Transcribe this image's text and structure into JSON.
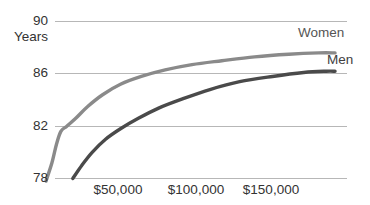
{
  "chart_data": {
    "type": "line",
    "title": "",
    "subtitle": "",
    "xlabel": "",
    "ylabel": "Years",
    "xlim": [
      0,
      200000
    ],
    "ylim": [
      78,
      90
    ],
    "grid": true,
    "legend_position": "inline-right",
    "y_ticks": [
      {
        "value": 90,
        "label": "90"
      },
      {
        "value": 86,
        "label": "86"
      },
      {
        "value": 82,
        "label": "82"
      },
      {
        "value": 78,
        "label": "78"
      }
    ],
    "x_ticks": [
      {
        "value": 50000,
        "label": "$50,000"
      },
      {
        "value": 100000,
        "label": "$100,000"
      },
      {
        "value": 150000,
        "label": "$150,000"
      }
    ],
    "series": [
      {
        "name": "Women",
        "label": "Women",
        "color": "#8a8a8a",
        "x": [
          2000,
          6000,
          9000,
          12000,
          16000,
          22000,
          30000,
          40000,
          52000,
          66000,
          82000,
          100000,
          120000,
          142000,
          165000,
          185000,
          196000
        ],
        "values": [
          77.8,
          79.2,
          80.6,
          81.6,
          82.0,
          82.6,
          83.5,
          84.4,
          85.2,
          85.8,
          86.3,
          86.7,
          87.0,
          87.3,
          87.5,
          87.6,
          87.6
        ]
      },
      {
        "name": "Men",
        "label": "Men",
        "color": "#4a4a4a",
        "color_note": "darker gray",
        "x": [
          20000,
          26000,
          33000,
          42000,
          52000,
          64000,
          78000,
          94000,
          112000,
          132000,
          154000,
          175000,
          190000,
          196000
        ],
        "values": [
          78.0,
          79.0,
          80.0,
          81.0,
          81.8,
          82.6,
          83.4,
          84.1,
          84.8,
          85.4,
          85.8,
          86.1,
          86.2,
          86.2
        ]
      }
    ]
  },
  "axes": {
    "unit_label": "Years"
  },
  "colors": {
    "gridline": "#b7b7b7",
    "text": "#333333",
    "women": "#8a8a8a",
    "men": "#4a4a4a",
    "background": "#ffffff"
  }
}
